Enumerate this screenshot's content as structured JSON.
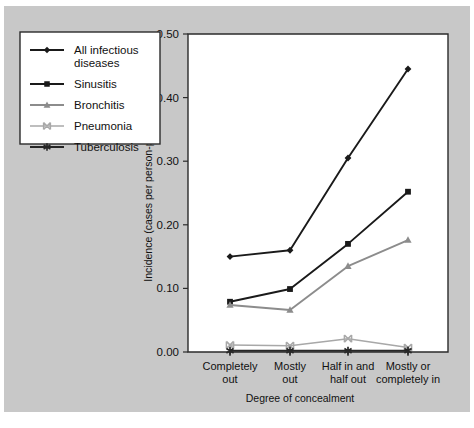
{
  "chart_data": {
    "type": "line",
    "title": "",
    "xlabel": "Degree of concealment",
    "ylabel": "Incidence (cases per person-per year)",
    "categories": [
      "Completely out",
      "Mostly out",
      "Half in and half out",
      "Mostly or completely in"
    ],
    "category_lines": [
      [
        "Completely",
        "out"
      ],
      [
        "Mostly",
        "out"
      ],
      [
        "Half in and",
        "half out"
      ],
      [
        "Mostly or",
        "completely in"
      ]
    ],
    "ylim": [
      0.0,
      0.5
    ],
    "yticks": [
      0.0,
      0.1,
      0.2,
      0.3,
      0.4,
      0.5
    ],
    "ytick_labels": [
      "0.00",
      "0.10",
      "0.20",
      "0.30",
      "0.40",
      "0.50"
    ],
    "grid": false,
    "legend_position": "outside-left-top",
    "series": [
      {
        "name": "All infectious diseases",
        "values": [
          0.15,
          0.16,
          0.305,
          0.445
        ],
        "color": "#1a1a1a",
        "marker": "diamond"
      },
      {
        "name": "Sinusitis",
        "values": [
          0.079,
          0.099,
          0.17,
          0.252
        ],
        "color": "#1a1a1a",
        "marker": "square"
      },
      {
        "name": "Bronchitis",
        "values": [
          0.074,
          0.066,
          0.135,
          0.176
        ],
        "color": "#8c8c8c",
        "marker": "triangle"
      },
      {
        "name": "Pneumonia",
        "values": [
          0.011,
          0.01,
          0.021,
          0.007
        ],
        "color": "#a8a8a8",
        "marker": "x"
      },
      {
        "name": "Tuberculosis",
        "values": [
          0.002,
          0.002,
          0.002,
          0.002
        ],
        "color": "#262626",
        "marker": "asterisk"
      }
    ]
  },
  "figure": {
    "background_color": "#c8c8c8",
    "plot_background_color": "#ffffff",
    "axis_color": "#2b2b2b"
  }
}
